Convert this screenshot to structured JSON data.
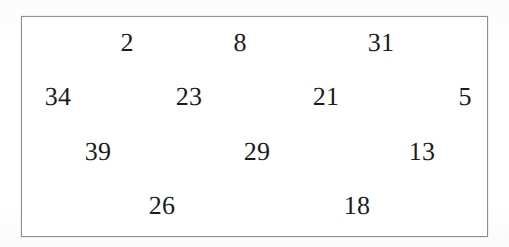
{
  "document": {
    "kind": "number-grid",
    "background_color": "#fdfdfd",
    "box": {
      "border_color": "#8d8d8d",
      "fill_color": "#ffffff",
      "left": 21,
      "top": 16,
      "width": 467,
      "height": 221
    },
    "text_color": "#1b1b1b",
    "font_size_px": 26
  },
  "grid": {
    "row_count": 4,
    "column_count_max": 4,
    "rows": [
      {
        "row_index": 1,
        "y": 42,
        "cells": [
          {
            "value": "2",
            "x": 126
          },
          {
            "value": "8",
            "x": 239
          },
          {
            "value": "31",
            "x": 380
          }
        ]
      },
      {
        "row_index": 2,
        "y": 96,
        "cells": [
          {
            "value": "34",
            "x": 57
          },
          {
            "value": "23",
            "x": 188
          },
          {
            "value": "21",
            "x": 325
          },
          {
            "value": "5",
            "x": 464
          }
        ]
      },
      {
        "row_index": 3,
        "y": 151,
        "cells": [
          {
            "value": "39",
            "x": 97
          },
          {
            "value": "29",
            "x": 256
          },
          {
            "value": "13",
            "x": 421
          }
        ]
      },
      {
        "row_index": 4,
        "y": 205,
        "cells": [
          {
            "value": "26",
            "x": 161
          },
          {
            "value": "18",
            "x": 356
          }
        ]
      }
    ]
  },
  "values_in_reading_order": [
    "2",
    "8",
    "31",
    "34",
    "23",
    "21",
    "5",
    "39",
    "29",
    "13",
    "26",
    "18"
  ]
}
